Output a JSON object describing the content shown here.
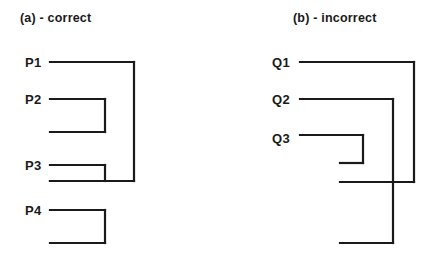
{
  "figure": {
    "background_color": "#ffffff",
    "line_color": "#1a1a1a",
    "width": 437,
    "height": 255
  },
  "panels": [
    {
      "id": "a",
      "caption": "(a) - correct",
      "caption_x": 20,
      "caption_y": 11,
      "labels": [
        {
          "text": "P1",
          "x": 25,
          "y": 55
        },
        {
          "text": "P2",
          "x": 25,
          "y": 92
        },
        {
          "text": "P3",
          "x": 25,
          "y": 158
        },
        {
          "text": "P4",
          "x": 25,
          "y": 203
        }
      ],
      "brackets": [
        {
          "name": "p1-bracket",
          "label": "P1",
          "x_start": 50,
          "x_corner": 134,
          "y_top": 62,
          "y_bottom": 181,
          "x_end": 50
        },
        {
          "name": "p2-bracket",
          "label": "P2",
          "x_start": 50,
          "x_corner": 105,
          "y_top": 99,
          "y_bottom": 132,
          "x_end": 50
        },
        {
          "name": "p3-bracket",
          "label": "P3",
          "x_start": 50,
          "x_corner": 105,
          "y_top": 165,
          "y_bottom": 181,
          "x_end": 50
        },
        {
          "name": "p4-bracket",
          "label": "P4",
          "x_start": 50,
          "x_corner": 105,
          "y_top": 210,
          "y_bottom": 243,
          "x_end": 50
        }
      ]
    },
    {
      "id": "b",
      "caption": "(b) - incorrect",
      "caption_x": 293,
      "caption_y": 11,
      "labels": [
        {
          "text": "Q1",
          "x": 272,
          "y": 55
        },
        {
          "text": "Q2",
          "x": 272,
          "y": 92
        },
        {
          "text": "Q3",
          "x": 272,
          "y": 131
        }
      ],
      "brackets": [
        {
          "name": "q1-bracket",
          "label": "Q1",
          "x_start": 300,
          "x_corner": 414,
          "y_top": 62,
          "y_bottom": 182,
          "x_end": 340
        },
        {
          "name": "q2-bracket",
          "label": "Q2",
          "x_start": 300,
          "x_corner": 393,
          "y_top": 99,
          "y_bottom": 243,
          "x_end": 340
        },
        {
          "name": "q3-bracket",
          "label": "Q3",
          "x_start": 300,
          "x_corner": 363,
          "y_top": 135,
          "y_bottom": 163,
          "x_end": 340
        }
      ],
      "note": "brackets cross each other"
    }
  ],
  "chart_data": {
    "type": "diagram",
    "title": "",
    "subtitle": "",
    "panels": [
      {
        "panel": "(a) - correct",
        "items": [
          "P1",
          "P2",
          "P3",
          "P4"
        ],
        "nesting": "properly nested: P2 and P3 brackets nest inside the P1 bracket; P4 bracket is separate",
        "crossings": 0
      },
      {
        "panel": "(b) - incorrect",
        "items": [
          "Q1",
          "Q2",
          "Q3"
        ],
        "nesting": "crossing: the Q1 bracket and the Q2 bracket overlap without nesting; Q3 nests inside",
        "crossings": 1
      }
    ]
  }
}
